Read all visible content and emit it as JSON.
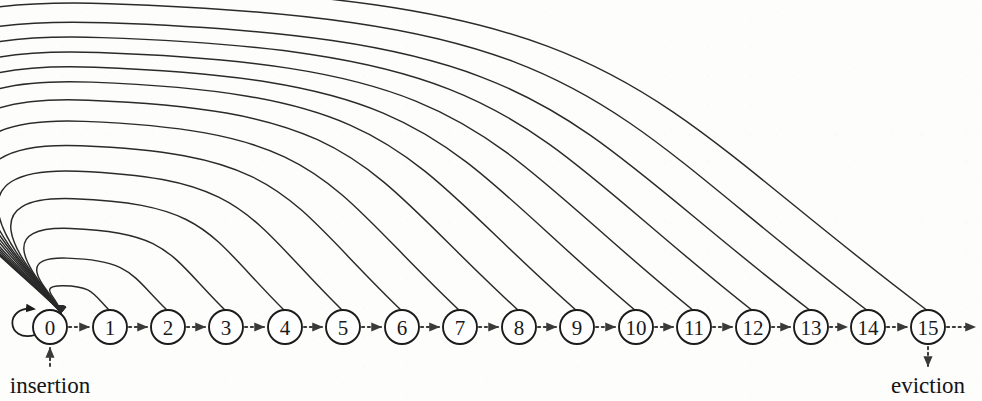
{
  "figure": {
    "type": "state-transition-diagram",
    "nodes": [
      {
        "id": 0,
        "label": "0",
        "cx": 50,
        "cy": 327
      },
      {
        "id": 1,
        "label": "1",
        "cx": 110,
        "cy": 327
      },
      {
        "id": 2,
        "label": "2",
        "cx": 168,
        "cy": 327
      },
      {
        "id": 3,
        "label": "3",
        "cx": 226,
        "cy": 327
      },
      {
        "id": 4,
        "label": "4",
        "cx": 285,
        "cy": 327
      },
      {
        "id": 5,
        "label": "5",
        "cx": 343,
        "cy": 327
      },
      {
        "id": 6,
        "label": "6",
        "cx": 402,
        "cy": 327
      },
      {
        "id": 7,
        "label": "7",
        "cx": 460,
        "cy": 327
      },
      {
        "id": 8,
        "label": "8",
        "cx": 519,
        "cy": 327
      },
      {
        "id": 9,
        "label": "9",
        "cx": 577,
        "cy": 327
      },
      {
        "id": 10,
        "label": "10",
        "cx": 636,
        "cy": 327
      },
      {
        "id": 11,
        "label": "11",
        "cx": 694,
        "cy": 327
      },
      {
        "id": 12,
        "label": "12",
        "cx": 753,
        "cy": 327
      },
      {
        "id": 13,
        "label": "13",
        "cx": 811,
        "cy": 327
      },
      {
        "id": 14,
        "label": "14",
        "cx": 868,
        "cy": 327
      },
      {
        "id": 15,
        "label": "15",
        "cx": 928,
        "cy": 327
      }
    ],
    "node_radius": 17,
    "forward_transitions": [
      {
        "from": 0,
        "to": 1
      },
      {
        "from": 1,
        "to": 2
      },
      {
        "from": 2,
        "to": 3
      },
      {
        "from": 3,
        "to": 4
      },
      {
        "from": 4,
        "to": 5
      },
      {
        "from": 5,
        "to": 6
      },
      {
        "from": 6,
        "to": 7
      },
      {
        "from": 7,
        "to": 8
      },
      {
        "from": 8,
        "to": 9
      },
      {
        "from": 9,
        "to": 10
      },
      {
        "from": 10,
        "to": 11
      },
      {
        "from": 11,
        "to": 12
      },
      {
        "from": 12,
        "to": 13
      },
      {
        "from": 13,
        "to": 14
      },
      {
        "from": 14,
        "to": 15
      }
    ],
    "back_arcs": [
      {
        "from": 1,
        "to": 0,
        "apex_y": 288
      },
      {
        "from": 2,
        "to": 0,
        "apex_y": 262
      },
      {
        "from": 3,
        "to": 0,
        "apex_y": 234
      },
      {
        "from": 4,
        "to": 0,
        "apex_y": 206
      },
      {
        "from": 5,
        "to": 0,
        "apex_y": 180
      },
      {
        "from": 6,
        "to": 0,
        "apex_y": 156
      },
      {
        "from": 7,
        "to": 0,
        "apex_y": 133
      },
      {
        "from": 8,
        "to": 0,
        "apex_y": 113
      },
      {
        "from": 9,
        "to": 0,
        "apex_y": 96
      },
      {
        "from": 10,
        "to": 0,
        "apex_y": 82
      },
      {
        "from": 11,
        "to": 0,
        "apex_y": 68
      },
      {
        "from": 12,
        "to": 0,
        "apex_y": 54
      },
      {
        "from": 13,
        "to": 0,
        "apex_y": 40
      },
      {
        "from": 14,
        "to": 0,
        "apex_y": 22
      },
      {
        "from": 15,
        "to": 0,
        "apex_y": 4
      }
    ],
    "self_loop": {
      "node": 0,
      "label": ""
    },
    "endpoints": {
      "insertion": {
        "label": "insertion",
        "x": 50,
        "y": 393,
        "direction": "up",
        "target_node": 0
      },
      "eviction": {
        "label": "eviction",
        "x": 928,
        "y": 393,
        "direction": "down",
        "source_node": 15
      }
    },
    "trailing_arrow": {
      "from_node": 15,
      "to_x": 975
    },
    "colors": {
      "node_stroke": "#1c1c1c",
      "node_fill": "#ffffff",
      "arc_stroke": "#2a2a2a",
      "dotted_stroke": "#3a3a3a",
      "text": "#141414",
      "background": "#fdfdfc"
    }
  },
  "page_bleed": {
    "line1": "",
    "line2": "",
    "line3": ""
  }
}
